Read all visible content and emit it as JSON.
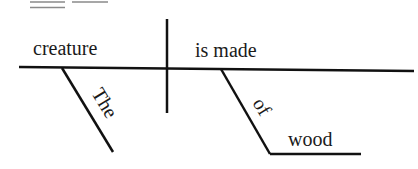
{
  "diagram": {
    "type": "sentence-diagram",
    "colors": {
      "ink": "#111111",
      "faint": "#888888"
    },
    "words": {
      "subject": "creature",
      "predicate": "is made",
      "article_modifier": "The",
      "preposition": "of",
      "prepositional_object": "wood"
    }
  }
}
